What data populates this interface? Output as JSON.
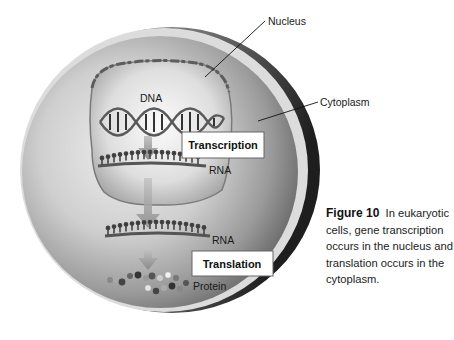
{
  "figure": {
    "labels": {
      "nucleus": "Nucleus",
      "cytoplasm": "Cytoplasm",
      "dna": "DNA",
      "rna_nucleus": "RNA",
      "rna_cytoplasm": "RNA",
      "protein": "Protein"
    },
    "process_boxes": {
      "transcription": "Transcription",
      "translation": "Translation"
    },
    "colors": {
      "cell_light": "#e6e6e6",
      "cell_mid": "#a9a9a9",
      "cell_dark": "#2e2e2e",
      "nucleus_interior": "#f0f0f0",
      "arrow": "#9a9a9a",
      "box_fill": "#ffffff",
      "text": "#111111"
    }
  },
  "caption": {
    "figure_number": "Figure 10",
    "text": "In eukaryotic cells, gene transcription occurs in the nucleus and translation occurs in the cytoplasm."
  }
}
